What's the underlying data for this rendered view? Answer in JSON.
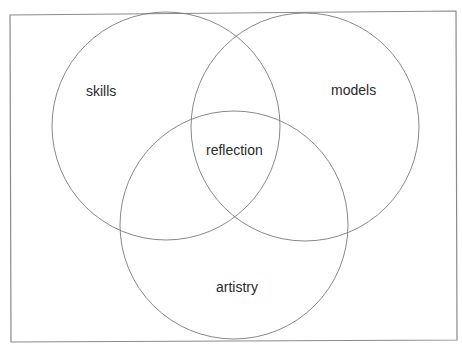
{
  "diagram": {
    "type": "venn",
    "sets": [
      {
        "label": "skills"
      },
      {
        "label": "models"
      },
      {
        "label": "artistry"
      }
    ],
    "intersection": {
      "label": "reflection"
    },
    "colors": {
      "stroke": "#7a7a7a",
      "frame": "#8a8a8a",
      "text": "#2a2a2a",
      "background": "#ffffff"
    }
  }
}
